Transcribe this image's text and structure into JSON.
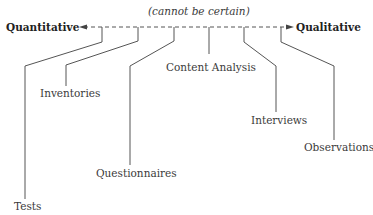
{
  "diagram": {
    "axis": {
      "left_label": "Quantitative",
      "right_label": "Qualitative",
      "note": "(cannot be certain)"
    },
    "methods": [
      {
        "id": "tests",
        "label": "Tests"
      },
      {
        "id": "inventories",
        "label": "Inventories"
      },
      {
        "id": "questionnaires",
        "label": "Questionnaires"
      },
      {
        "id": "content-analysis",
        "label": "Content Analysis"
      },
      {
        "id": "interviews",
        "label": "Interviews"
      },
      {
        "id": "observations",
        "label": "Observations"
      }
    ]
  }
}
